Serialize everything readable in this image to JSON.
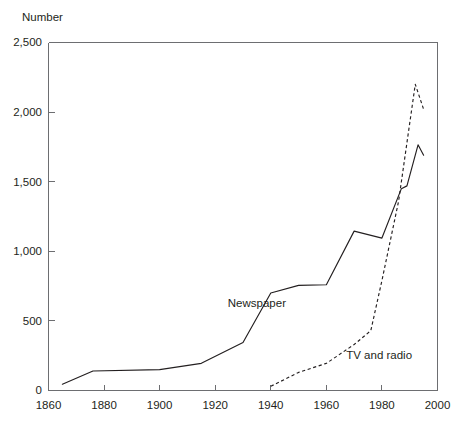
{
  "chart_data": {
    "type": "line",
    "title": "",
    "ylabel": "Number",
    "xlabel": "",
    "xlim": [
      1860,
      2000
    ],
    "ylim": [
      0,
      2500
    ],
    "grid": false,
    "legend_position": "inline-annotations",
    "x_ticks": [
      "1860",
      "1880",
      "1900",
      "1920",
      "1940",
      "1960",
      "1980",
      "2000"
    ],
    "x_tick_values": [
      1860,
      1880,
      1900,
      1920,
      1940,
      1960,
      1980,
      2000
    ],
    "y_ticks": [
      "0",
      "500",
      "1,000",
      "1,500",
      "2,000",
      "2,500"
    ],
    "y_tick_values": [
      0,
      500,
      1000,
      1500,
      2000,
      2500
    ],
    "series": [
      {
        "name": "Newspaper",
        "style": "solid",
        "label": "Newspaper",
        "label_x": 1935,
        "label_y": 600,
        "points": [
          [
            1865,
            45
          ],
          [
            1876,
            140
          ],
          [
            1900,
            150
          ],
          [
            1915,
            195
          ],
          [
            1930,
            345
          ],
          [
            1940,
            700
          ],
          [
            1950,
            755
          ],
          [
            1960,
            760
          ],
          [
            1970,
            1145
          ],
          [
            1980,
            1095
          ],
          [
            1987,
            1450
          ],
          [
            1989,
            1470
          ],
          [
            1993,
            1765
          ],
          [
            1995,
            1690
          ]
        ]
      },
      {
        "name": "TV and radio",
        "style": "dashed",
        "label": "TV and radio",
        "label_x": 1979,
        "label_y": 225,
        "points": [
          [
            1940,
            30
          ],
          [
            1950,
            130
          ],
          [
            1960,
            195
          ],
          [
            1970,
            330
          ],
          [
            1976,
            430
          ],
          [
            1980,
            790
          ],
          [
            1986,
            1360
          ],
          [
            1992,
            2200
          ],
          [
            1995,
            2020
          ]
        ]
      }
    ]
  },
  "labels": {
    "y_axis_title": "Number"
  }
}
